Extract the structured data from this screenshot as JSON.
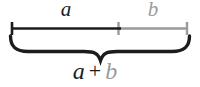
{
  "diagram": {
    "labels": {
      "segment_a": "a",
      "segment_b": "b",
      "sum_a": "a",
      "sum_plus": "+",
      "sum_b": "b"
    },
    "colors": {
      "primary": "#1c1c1c",
      "secondary": "#9a9a9a",
      "background": "#ffffff"
    }
  }
}
